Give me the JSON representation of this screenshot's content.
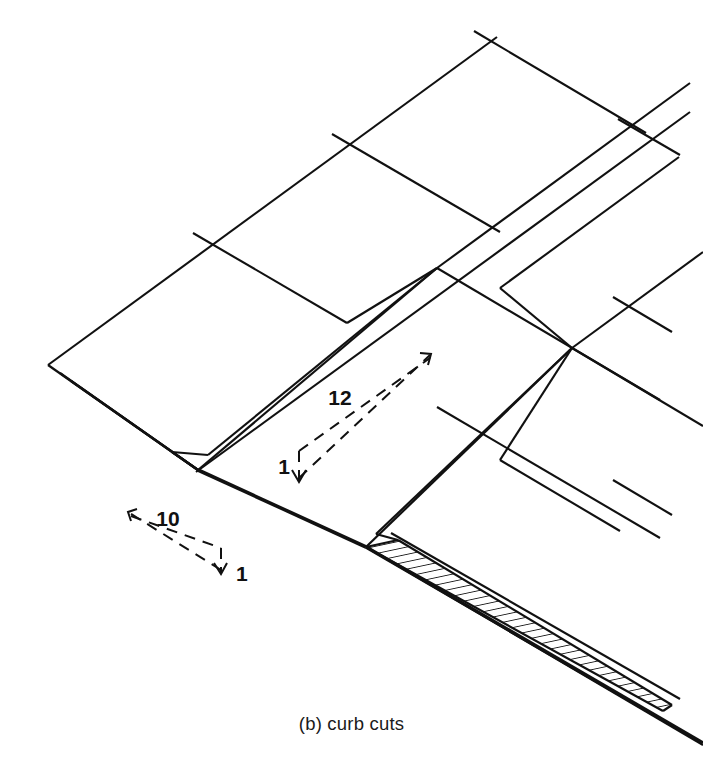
{
  "figure": {
    "caption": "(b) curb cuts",
    "title": "curb cuts",
    "view": "axonometric",
    "line_color": "#111111",
    "background_color": "#ffffff"
  },
  "annotations": {
    "left_ramp_slope": {
      "run_label": "10",
      "rise_label": "1",
      "ratio": "10:1",
      "style": "dashed-triangle"
    },
    "right_ramp_slope": {
      "run_label": "12",
      "rise_label": "1",
      "ratio": "12:1",
      "style": "dashed-triangle"
    }
  },
  "elements": {
    "sidewalk": "sidewalk paving grid",
    "curb_left": "hatched curb tapering to flush at ramp",
    "curb_right": "hatched curb tapering to flush at ramp",
    "ramp_left": "curb cut ramp with flared sides",
    "ramp_right": "curb cut ramp with flared sides",
    "gutter": "gutter / street edge line"
  }
}
